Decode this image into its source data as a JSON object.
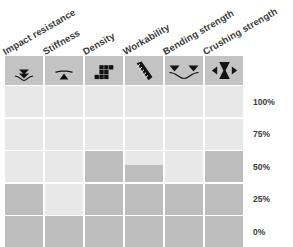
{
  "chart_data": {
    "type": "bar",
    "title": "",
    "subtitle": "",
    "xlabel": "",
    "ylabel": "",
    "orientation": "vertical",
    "grid": true,
    "legend": false,
    "ylim": [
      0,
      100
    ],
    "y_ticks": [
      "0%",
      "25%",
      "50%",
      "75%",
      "100%"
    ],
    "y_tick_values": [
      0,
      25,
      50,
      75,
      100
    ],
    "categories": [
      "Impact resistance",
      "Stiffness",
      "Density",
      "Workability",
      "Bending strength",
      "Crushing strength"
    ],
    "values": [
      37.5,
      12.5,
      62.5,
      55,
      37.5,
      62.5
    ],
    "track_color": "#e8e8e8",
    "fill_color": "#bdbdbd",
    "header_band_color": "#c3c3c3",
    "background_color": "#ffffff",
    "text_color": "#3b3b3b"
  },
  "columns": [
    {
      "label": "Impact resistance",
      "icon": "impact-arrows-icon",
      "value": 37.5,
      "cells": [
        0,
        0,
        0,
        100,
        100
      ]
    },
    {
      "label": "Stiffness",
      "icon": "beam-fulcrum-icon",
      "value": 12.5,
      "cells": [
        0,
        0,
        0,
        0,
        100
      ]
    },
    {
      "label": "Density",
      "icon": "stacked-blocks-icon",
      "value": 62.5,
      "cells": [
        0,
        0,
        100,
        100,
        100
      ]
    },
    {
      "label": "Workability",
      "icon": "file-tool-icon",
      "value": 55,
      "cells": [
        0,
        0,
        55,
        100,
        100
      ]
    },
    {
      "label": "Bending strength",
      "icon": "bending-load-icon",
      "value": 37.5,
      "cells": [
        0,
        0,
        0,
        100,
        100
      ]
    },
    {
      "label": "Crushing strength",
      "icon": "compression-hourglass-icon",
      "value": 62.5,
      "cells": [
        0,
        0,
        100,
        100,
        100
      ]
    }
  ],
  "axis": {
    "ticks": [
      {
        "label": "100%"
      },
      {
        "label": "75%"
      },
      {
        "label": "50%"
      },
      {
        "label": "25%"
      },
      {
        "label": "0%"
      }
    ]
  }
}
